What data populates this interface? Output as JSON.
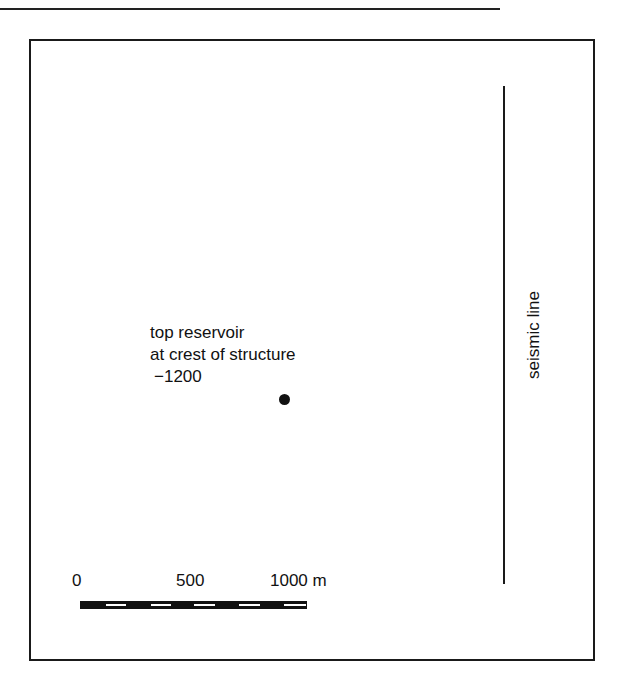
{
  "map": {
    "labels": {
      "line1": "top reservoir",
      "line2": "at crest of structure",
      "depth": "−1200"
    },
    "seismic_line": {
      "label": "seismic line"
    },
    "scale_bar": {
      "tick_0": "0",
      "tick_500": "500",
      "tick_1000": "1000 m",
      "segments": [
        "black",
        "white",
        "black",
        "white",
        "black",
        "white",
        "black",
        "white",
        "black",
        "white"
      ]
    }
  }
}
